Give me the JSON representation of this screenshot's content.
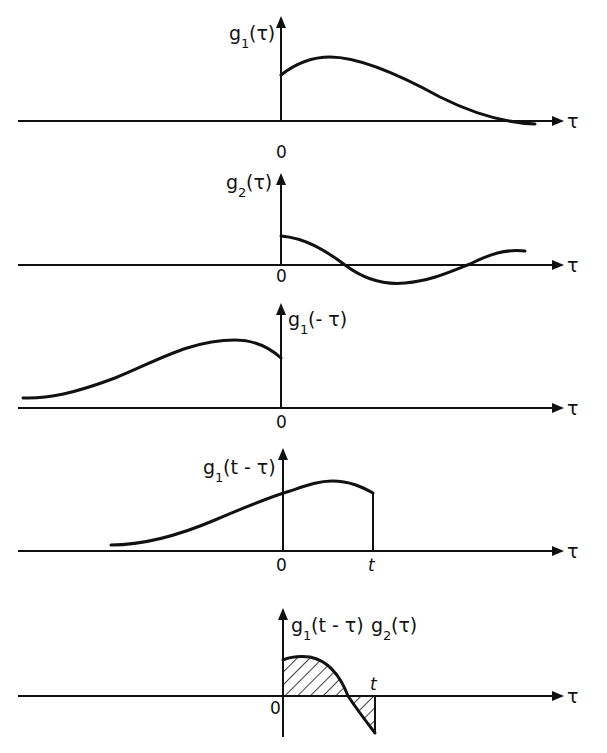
{
  "figure": {
    "panels": [
      {
        "id": "p1",
        "ylabel_main": "g",
        "ylabel_sub": "1",
        "ylabel_arg": "(τ)",
        "xlabel": "τ",
        "origin": "0"
      },
      {
        "id": "p2",
        "ylabel_main": "g",
        "ylabel_sub": "2",
        "ylabel_arg": "(τ)",
        "xlabel": "τ",
        "origin": "0"
      },
      {
        "id": "p3",
        "ylabel_main": "g",
        "ylabel_sub": "1",
        "ylabel_arg": "(- τ)",
        "xlabel": "τ",
        "origin": "0"
      },
      {
        "id": "p4",
        "ylabel_main": "g",
        "ylabel_sub": "1",
        "ylabel_arg": "(t - τ)",
        "xlabel": "τ",
        "origin": "0",
        "t_label": "t"
      },
      {
        "id": "p5",
        "ylabel_main": "g",
        "ylabel_sub": "1",
        "ylabel_arg": "(t - τ)",
        "ylabel_main2": "g",
        "ylabel_sub2": "2",
        "ylabel_arg2": "(τ)",
        "xlabel": "τ",
        "origin": "0",
        "t_label": "t"
      }
    ],
    "colors": {
      "ink": "#111111",
      "background": "#ffffff"
    }
  }
}
